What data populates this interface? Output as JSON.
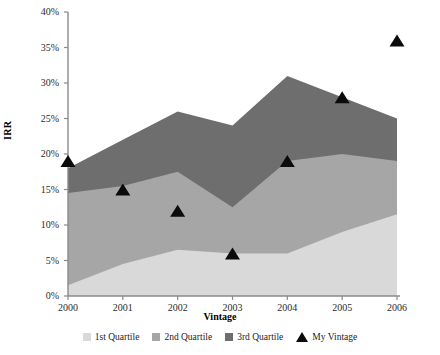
{
  "chart_data": {
    "type": "area",
    "title": "",
    "xlabel": "Vintage",
    "ylabel": "IRR",
    "categories": [
      "2000",
      "2001",
      "2002",
      "2003",
      "2004",
      "2005",
      "2006"
    ],
    "x": [
      2000,
      2001,
      2002,
      2003,
      2004,
      2005,
      2006
    ],
    "ylim": [
      0,
      40
    ],
    "xlim": [
      2000,
      2006
    ],
    "ytick_labels": [
      "0%",
      "5%",
      "10%",
      "15%",
      "20%",
      "25%",
      "30%",
      "35%",
      "40%"
    ],
    "ytick_values": [
      0,
      5,
      10,
      15,
      20,
      25,
      30,
      35,
      40
    ],
    "grid": false,
    "legend_position": "bottom",
    "stacked": true,
    "series": [
      {
        "name": "1st Quartile",
        "type": "area",
        "color": "#d9d9d9",
        "values": [
          1.5,
          4.5,
          6.5,
          6.0,
          6.0,
          9.0,
          11.5
        ],
        "cumulative": [
          1.5,
          4.5,
          6.5,
          6.0,
          6.0,
          9.0,
          11.5
        ]
      },
      {
        "name": "2nd Quartile",
        "type": "area",
        "color": "#a6a6a6",
        "values": [
          13.0,
          11.0,
          11.0,
          6.5,
          13.0,
          11.0,
          7.5
        ],
        "cumulative": [
          14.5,
          15.5,
          17.5,
          12.5,
          19.0,
          20.0,
          19.0
        ]
      },
      {
        "name": "3rd Quartile",
        "type": "area",
        "color": "#6e6e6e",
        "values": [
          3.5,
          6.5,
          8.5,
          11.5,
          12.0,
          8.0,
          6.0
        ],
        "cumulative": [
          18.0,
          22.0,
          26.0,
          24.0,
          31.0,
          28.0,
          25.0
        ]
      },
      {
        "name": "My Vintage",
        "type": "scatter",
        "marker": "triangle",
        "color": "#0b0b0b",
        "values": [
          19.0,
          15.0,
          12.0,
          6.0,
          19.0,
          28.0,
          36.0
        ]
      }
    ]
  },
  "axes": {
    "y_title": "IRR",
    "x_title": "Vintage"
  },
  "legend": {
    "items": [
      {
        "label": "1st Quartile",
        "icon": "square-swatch",
        "color": "#d9d9d9"
      },
      {
        "label": "2nd Quartile",
        "icon": "square-swatch",
        "color": "#a6a6a6"
      },
      {
        "label": "3rd Quartile",
        "icon": "square-swatch",
        "color": "#6e6e6e"
      },
      {
        "label": "My Vintage",
        "icon": "triangle-marker",
        "color": "#0b0b0b"
      }
    ]
  },
  "style": {
    "axis_color": "#8a8a8a",
    "text_color": "#2b2b2b",
    "background": "#ffffff"
  }
}
